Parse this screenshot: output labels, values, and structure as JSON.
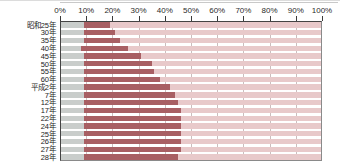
{
  "chart_data": {
    "type": "bar",
    "orientation": "horizontal",
    "stacked": true,
    "stacked_percent": true,
    "title": "",
    "subtitle": "",
    "xlabel": "",
    "ylabel": "",
    "xlim": [
      0,
      100
    ],
    "xtick_labels": [
      "0%",
      "10%",
      "20%",
      "30%",
      "40%",
      "50%",
      "60%",
      "70%",
      "80%",
      "90%",
      "100%"
    ],
    "xticks": [
      0,
      10,
      20,
      30,
      40,
      50,
      60,
      70,
      80,
      90,
      100
    ],
    "grid": true,
    "grid_axis": "x",
    "legend": null,
    "legend_position": "none",
    "categories": [
      "昭和25年",
      "30年",
      "35年",
      "40年",
      "45年",
      "50年",
      "55年",
      "60年",
      "平成2年",
      "7年",
      "12年",
      "17年",
      "22年",
      "24年",
      "25年",
      "26年",
      "27年",
      "28年"
    ],
    "series": [
      {
        "name": "segment-1",
        "color": "#c9cdcb",
        "values": [
          9,
          9,
          9,
          8,
          9,
          9,
          9,
          9,
          9,
          9,
          9,
          9,
          9,
          9,
          9,
          9,
          9,
          9
        ]
      },
      {
        "name": "segment-2",
        "color": "#a85f63",
        "values": [
          10,
          12,
          14,
          18,
          22,
          26,
          27,
          29,
          33,
          35,
          36,
          37,
          37,
          37,
          37,
          37,
          37,
          36
        ]
      },
      {
        "name": "segment-3",
        "color": "#e8c9ca",
        "values": [
          81,
          79,
          77,
          74,
          69,
          65,
          64,
          62,
          58,
          56,
          55,
          54,
          54,
          54,
          54,
          54,
          54,
          55
        ]
      }
    ],
    "cumulative_segment2_end": [
      19,
      21,
      23,
      26,
      31,
      35,
      36,
      38,
      42,
      44,
      45,
      46,
      46,
      46,
      46,
      46,
      46,
      45
    ]
  },
  "colors": {
    "segment_gray": "#c9cdcb",
    "segment_dark_red": "#a85f63",
    "segment_light_pink": "#e8c9ca",
    "gridline": "#b9a8a8",
    "axis": "#444444",
    "text": "#1d1d1d",
    "background": "#ffffff"
  }
}
